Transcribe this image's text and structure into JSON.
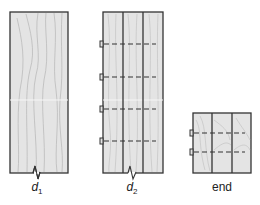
{
  "diagram": {
    "panels": [
      {
        "id": "d1",
        "label_main": "d",
        "label_sub": "1",
        "boards": 1,
        "fasteners": 0
      },
      {
        "id": "d2",
        "label_main": "d",
        "label_sub": "2",
        "boards": 3,
        "fasteners": 4
      },
      {
        "id": "end",
        "label": "end",
        "boards": 3,
        "fasteners": 2
      }
    ],
    "colors": {
      "wood": "#e4e4e4",
      "grain": "#b9b9b9",
      "outline": "#333333",
      "dash": "#333333"
    }
  }
}
